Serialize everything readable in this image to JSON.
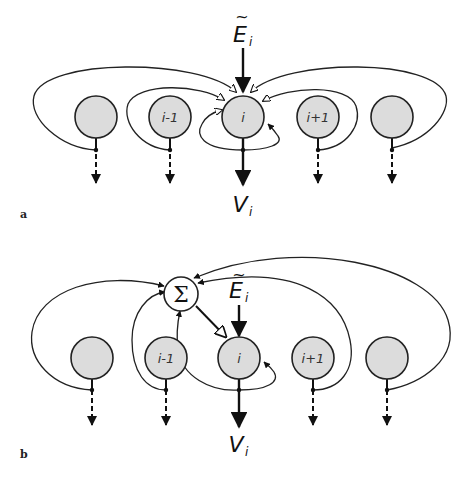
{
  "panels": {
    "a": {
      "tag": "a",
      "nodes": [
        {
          "label": ""
        },
        {
          "label": "i-1"
        },
        {
          "label": "i"
        },
        {
          "label": "i+1"
        },
        {
          "label": ""
        }
      ],
      "input_label": "E",
      "input_tilde": "~",
      "input_sub": "i",
      "output_label": "V",
      "output_sub": "i"
    },
    "b": {
      "tag": "b",
      "sum_symbol": "Σ",
      "nodes": [
        {
          "label": ""
        },
        {
          "label": "i-1"
        },
        {
          "label": "i"
        },
        {
          "label": "i+1"
        },
        {
          "label": ""
        }
      ],
      "input_label": "E",
      "input_tilde": "~",
      "input_sub": "i",
      "output_label": "V",
      "output_sub": "i"
    }
  },
  "colors": {
    "node_fill": "#dcdcdc",
    "stroke": "#222222",
    "background": "#ffffff"
  }
}
